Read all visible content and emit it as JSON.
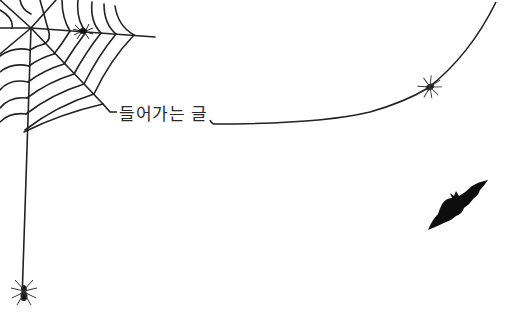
{
  "page": {
    "title_label": "들어가는 글"
  },
  "decorations": {
    "web": "spider-web-icon",
    "spider_on_web": "spider-icon",
    "spider_on_thread": "spider-icon",
    "hanging_spider": "spider-icon",
    "bat": "bat-icon"
  },
  "colors": {
    "background": "#ffffff",
    "line": "#222222",
    "fill": "#111111",
    "text": "#2a2a2a"
  }
}
